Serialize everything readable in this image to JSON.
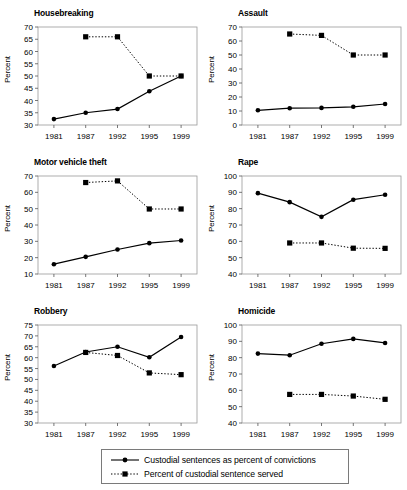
{
  "figure": {
    "categories": [
      "1981",
      "1987",
      "1992",
      "1995",
      "1999"
    ],
    "ylabel": "Percent",
    "legend": {
      "series1_label": "Custodial sentences as percent of convictions",
      "series2_label": "Percent of custodial sentence served",
      "series1_style": "solid-line-circle-marker",
      "series2_style": "dotted-line-square-marker"
    },
    "colors": {
      "line": "#000000",
      "axis": "#808080",
      "background": "#ffffff"
    }
  },
  "chart_data": [
    {
      "type": "line",
      "title": "Housebreaking",
      "xlabel": "",
      "ylabel": "Percent",
      "x": [
        "1981",
        "1987",
        "1992",
        "1995",
        "1999"
      ],
      "ylim": [
        30,
        70
      ],
      "yticks": [
        30,
        35,
        40,
        45,
        50,
        55,
        60,
        65,
        70
      ],
      "grid": false,
      "legend_position": "below-figure",
      "series": [
        {
          "name": "Custodial sentences as percent of convictions",
          "values": [
            32.4,
            35.0,
            36.5,
            43.8,
            50.0
          ]
        },
        {
          "name": "Percent of custodial sentence served",
          "values": [
            null,
            66.0,
            66.0,
            50.0,
            50.0
          ]
        }
      ]
    },
    {
      "type": "line",
      "title": "Assault",
      "xlabel": "",
      "ylabel": "Percent",
      "x": [
        "1981",
        "1987",
        "1992",
        "1995",
        "1999"
      ],
      "ylim": [
        0,
        70
      ],
      "yticks": [
        0,
        10,
        20,
        30,
        40,
        50,
        60,
        70
      ],
      "grid": false,
      "legend_position": "below-figure",
      "series": [
        {
          "name": "Custodial sentences as percent of convictions",
          "values": [
            10.5,
            12.0,
            12.2,
            13.0,
            15.0
          ]
        },
        {
          "name": "Percent of custodial sentence served",
          "values": [
            null,
            65.0,
            64.0,
            50.0,
            50.0
          ]
        }
      ]
    },
    {
      "type": "line",
      "title": "Motor vehicle theft",
      "xlabel": "",
      "ylabel": "Percent",
      "x": [
        "1981",
        "1987",
        "1992",
        "1995",
        "1999"
      ],
      "ylim": [
        10,
        70
      ],
      "yticks": [
        10,
        20,
        30,
        40,
        50,
        60,
        70
      ],
      "grid": false,
      "legend_position": "below-figure",
      "series": [
        {
          "name": "Custodial sentences as percent of convictions",
          "values": [
            16.0,
            20.5,
            25.0,
            28.9,
            30.5
          ]
        },
        {
          "name": "Percent of custodial sentence served",
          "values": [
            null,
            66.0,
            67.0,
            49.8,
            49.8
          ]
        }
      ]
    },
    {
      "type": "line",
      "title": "Rape",
      "xlabel": "",
      "ylabel": "Percent",
      "x": [
        "1981",
        "1987",
        "1992",
        "1995",
        "1999"
      ],
      "ylim": [
        40,
        100
      ],
      "yticks": [
        40,
        50,
        60,
        70,
        80,
        90,
        100
      ],
      "grid": false,
      "legend_position": "below-figure",
      "series": [
        {
          "name": "Custodial sentences as percent of convictions",
          "values": [
            89.5,
            84.0,
            75.0,
            85.5,
            88.5
          ]
        },
        {
          "name": "Percent of custodial sentence served",
          "values": [
            null,
            59.0,
            59.0,
            55.8,
            55.7
          ]
        }
      ]
    },
    {
      "type": "line",
      "title": "Robbery",
      "xlabel": "",
      "ylabel": "Percent",
      "x": [
        "1981",
        "1987",
        "1992",
        "1995",
        "1999"
      ],
      "ylim": [
        30,
        75
      ],
      "yticks": [
        30,
        35,
        40,
        45,
        50,
        55,
        60,
        65,
        70,
        75
      ],
      "grid": false,
      "legend_position": "below-figure",
      "series": [
        {
          "name": "Custodial sentences as percent of convictions",
          "values": [
            56.2,
            62.6,
            65.0,
            60.2,
            69.5
          ]
        },
        {
          "name": "Percent of custodial sentence served",
          "values": [
            null,
            62.4,
            61.0,
            53.0,
            52.2
          ]
        }
      ]
    },
    {
      "type": "line",
      "title": "Homicide",
      "xlabel": "",
      "ylabel": "Percent",
      "x": [
        "1981",
        "1987",
        "1992",
        "1995",
        "1999"
      ],
      "ylim": [
        40,
        100
      ],
      "yticks": [
        40,
        50,
        60,
        70,
        80,
        90,
        100
      ],
      "grid": false,
      "legend_position": "below-figure",
      "series": [
        {
          "name": "Custodial sentences as percent of convictions",
          "values": [
            82.5,
            81.5,
            88.5,
            91.5,
            89.0
          ]
        },
        {
          "name": "Percent of custodial sentence served",
          "values": [
            null,
            57.5,
            57.5,
            56.5,
            54.5
          ]
        }
      ]
    }
  ]
}
